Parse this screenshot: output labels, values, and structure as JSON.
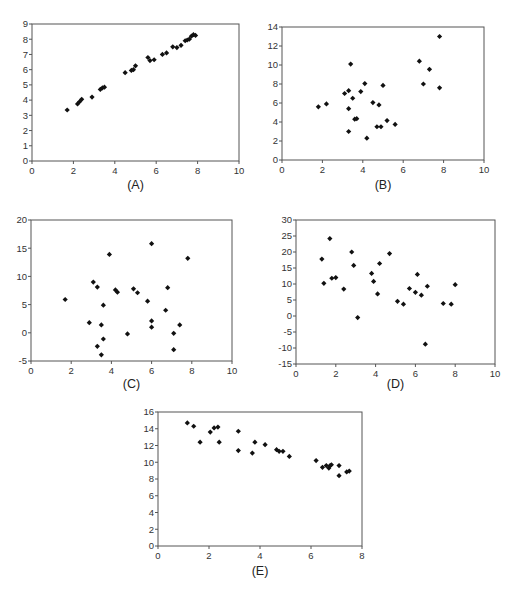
{
  "figure": {
    "panels": [
      "(A)",
      "(B)",
      "(C)",
      "(D)",
      "(E)"
    ]
  },
  "layout": {
    "panels": [
      {
        "x0": 32,
        "x1": 239,
        "y0": 24,
        "y1": 161,
        "label_y": 189
      },
      {
        "x0": 282,
        "x1": 484,
        "y0": 27,
        "y1": 160,
        "label_y": 189
      },
      {
        "x0": 31,
        "x1": 232,
        "y0": 220,
        "y1": 361,
        "label_y": 388
      },
      {
        "x0": 296,
        "x1": 495,
        "y0": 220,
        "y1": 364,
        "label_y": 388
      },
      {
        "x0": 158,
        "x1": 362,
        "y0": 412,
        "y1": 546,
        "label_y": 575
      }
    ],
    "marker_color": "#111111",
    "frame_color": "#555555"
  },
  "chart_data": [
    {
      "type": "scatter",
      "title": "(A)",
      "xlabel": "",
      "ylabel": "",
      "xlim": [
        0,
        10
      ],
      "ylim": [
        0,
        9
      ],
      "xticks": [
        0,
        2,
        4,
        6,
        8,
        10
      ],
      "yticks": [
        0,
        1,
        2,
        3,
        4,
        5,
        6,
        7,
        8,
        9
      ],
      "grid": false,
      "legend": null,
      "x": [
        1.7,
        2.2,
        2.3,
        2.4,
        2.9,
        3.3,
        3.4,
        3.5,
        4.5,
        4.8,
        4.9,
        5.0,
        5.6,
        5.7,
        5.9,
        6.3,
        6.5,
        6.8,
        7.0,
        7.2,
        7.4,
        7.5,
        7.6,
        7.7,
        7.8,
        7.9
      ],
      "y": [
        3.35,
        3.75,
        3.9,
        4.05,
        4.2,
        4.7,
        4.8,
        4.85,
        5.8,
        5.95,
        6.0,
        6.25,
        6.8,
        6.6,
        6.65,
        7.0,
        7.1,
        7.5,
        7.45,
        7.6,
        7.9,
        7.95,
        8.0,
        8.2,
        8.3,
        8.25
      ]
    },
    {
      "type": "scatter",
      "title": "(B)",
      "xlabel": "",
      "ylabel": "",
      "xlim": [
        0,
        10
      ],
      "ylim": [
        0,
        14
      ],
      "xticks": [
        0,
        2,
        4,
        6,
        8,
        10
      ],
      "yticks": [
        0,
        2,
        4,
        6,
        8,
        10,
        12,
        14
      ],
      "grid": false,
      "legend": null,
      "x": [
        1.8,
        2.2,
        3.1,
        3.3,
        3.4,
        3.3,
        3.5,
        3.6,
        3.7,
        3.3,
        3.9,
        4.1,
        4.2,
        4.5,
        4.8,
        4.7,
        4.9,
        5.0,
        5.2,
        5.6,
        6.8,
        7.0,
        7.3,
        7.8,
        7.8
      ],
      "y": [
        5.6,
        5.9,
        7.0,
        7.3,
        10.1,
        5.4,
        6.5,
        4.3,
        4.35,
        3.0,
        7.2,
        8.05,
        2.3,
        6.05,
        5.8,
        3.5,
        3.5,
        7.85,
        4.15,
        3.75,
        10.4,
        8.0,
        9.55,
        7.6,
        13.0
      ]
    },
    {
      "type": "scatter",
      "title": "(C)",
      "xlabel": "",
      "ylabel": "",
      "xlim": [
        0,
        10
      ],
      "ylim": [
        -5,
        20
      ],
      "xticks": [
        0,
        2,
        4,
        6,
        8,
        10
      ],
      "yticks": [
        -5,
        0,
        5,
        10,
        15,
        20
      ],
      "grid": false,
      "legend": null,
      "x": [
        1.7,
        2.9,
        3.1,
        3.3,
        3.3,
        3.5,
        3.5,
        3.6,
        3.6,
        3.9,
        4.2,
        4.3,
        4.8,
        5.1,
        5.3,
        5.8,
        6.0,
        6.0,
        6.0,
        6.7,
        6.8,
        7.1,
        7.1,
        7.4,
        7.8
      ],
      "y": [
        5.9,
        1.8,
        9.0,
        8.1,
        -2.4,
        1.4,
        -3.9,
        4.9,
        -1.1,
        13.9,
        7.6,
        7.2,
        -0.2,
        7.8,
        7.1,
        5.6,
        15.8,
        2.1,
        1.0,
        4.0,
        8.0,
        -0.1,
        -3.0,
        1.4,
        13.2
      ]
    },
    {
      "type": "scatter",
      "title": "(D)",
      "xlabel": "",
      "ylabel": "",
      "xlim": [
        0,
        10
      ],
      "ylim": [
        -15,
        30
      ],
      "xticks": [
        0,
        2,
        4,
        6,
        8,
        10
      ],
      "yticks": [
        -15,
        -10,
        -5,
        0,
        5,
        10,
        15,
        20,
        25,
        30
      ],
      "grid": false,
      "legend": null,
      "x": [
        1.3,
        1.4,
        1.7,
        1.8,
        2.0,
        2.4,
        2.8,
        2.9,
        3.1,
        3.8,
        3.9,
        4.1,
        4.2,
        4.7,
        5.1,
        5.4,
        5.7,
        6.0,
        6.1,
        6.3,
        6.5,
        6.6,
        7.4,
        7.8,
        8.0
      ],
      "y": [
        17.8,
        10.2,
        24.2,
        11.8,
        12.0,
        8.4,
        20.0,
        15.8,
        -0.5,
        13.3,
        10.8,
        6.9,
        16.4,
        19.5,
        4.6,
        3.7,
        8.6,
        7.4,
        13.0,
        6.5,
        -8.8,
        9.3,
        3.9,
        3.7,
        9.8
      ]
    },
    {
      "type": "scatter",
      "title": "(E)",
      "xlabel": "",
      "ylabel": "",
      "xlim": [
        0,
        8
      ],
      "ylim": [
        0,
        16
      ],
      "xticks": [
        0,
        2,
        4,
        6,
        8
      ],
      "yticks": [
        0,
        2,
        4,
        6,
        8,
        10,
        12,
        14,
        16
      ],
      "grid": false,
      "legend": null,
      "x": [
        1.15,
        1.4,
        1.65,
        2.05,
        2.2,
        2.35,
        2.4,
        3.15,
        3.15,
        3.7,
        3.8,
        4.2,
        4.65,
        4.75,
        4.9,
        5.15,
        6.2,
        6.45,
        6.6,
        6.7,
        6.75,
        6.8,
        7.1,
        7.1,
        7.4,
        7.5
      ],
      "y": [
        14.7,
        14.3,
        12.4,
        13.6,
        14.1,
        14.2,
        12.4,
        13.7,
        11.4,
        11.1,
        12.4,
        12.1,
        11.5,
        11.3,
        11.3,
        10.7,
        10.2,
        9.4,
        9.6,
        9.3,
        9.6,
        9.7,
        9.6,
        8.4,
        8.85,
        8.95
      ]
    }
  ]
}
